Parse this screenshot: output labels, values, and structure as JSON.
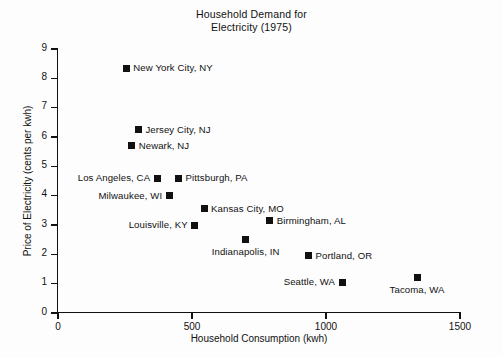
{
  "chart_data": {
    "type": "scatter",
    "title": "Household Demand for Electricity (1975)",
    "title_line1": "Household Demand for",
    "title_line2": "Electricity (1975)",
    "xlabel": "Household Consumption (kwh)",
    "ylabel": "Price of Electricity (cents per kwh)",
    "xlim": [
      0,
      1500
    ],
    "ylim": [
      0,
      9
    ],
    "xticks": [
      "0",
      "500",
      "1000",
      "1500"
    ],
    "xtick_values": [
      0,
      500,
      1000,
      1500
    ],
    "yticks": [
      "0",
      "1",
      "2",
      "3",
      "4",
      "5",
      "6",
      "7",
      "8",
      "9"
    ],
    "ytick_values": [
      0,
      1,
      2,
      3,
      4,
      5,
      6,
      7,
      8,
      9
    ],
    "grid": false,
    "legend": "none",
    "marker_style": "filled-square",
    "marker_color": "#111111",
    "points": [
      {
        "label": "New York City, NY",
        "x": 255,
        "y": 8.35,
        "label_side": "right"
      },
      {
        "label": "Jersey City, NJ",
        "x": 300,
        "y": 6.25,
        "label_side": "right"
      },
      {
        "label": "Newark, NJ",
        "x": 275,
        "y": 5.7,
        "label_side": "right"
      },
      {
        "label": "Los Angeles, CA",
        "x": 370,
        "y": 4.6,
        "label_side": "left"
      },
      {
        "label": "Pittsburgh, PA",
        "x": 450,
        "y": 4.6,
        "label_side": "right"
      },
      {
        "label": "Milwaukee, WI",
        "x": 415,
        "y": 4.0,
        "label_side": "left"
      },
      {
        "label": "Kansas City, MO",
        "x": 545,
        "y": 3.55,
        "label_side": "right"
      },
      {
        "label": "Birmingham, AL",
        "x": 790,
        "y": 3.15,
        "label_side": "right"
      },
      {
        "label": "Louisville, KY",
        "x": 510,
        "y": 3.0,
        "label_side": "left"
      },
      {
        "label": "Indianapolis, IN",
        "x": 700,
        "y": 2.5,
        "label_side": "below"
      },
      {
        "label": "Portland, OR",
        "x": 935,
        "y": 1.95,
        "label_side": "right"
      },
      {
        "label": "Seattle, WA",
        "x": 1060,
        "y": 1.05,
        "label_side": "left"
      },
      {
        "label": "Tacoma, WA",
        "x": 1340,
        "y": 1.2,
        "label_side": "below"
      }
    ]
  }
}
